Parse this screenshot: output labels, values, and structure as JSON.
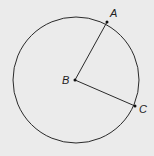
{
  "diagram": {
    "type": "circle-with-radii",
    "circle": {
      "center": "B",
      "cx": 76,
      "cy": 80,
      "r": 63
    },
    "points": [
      {
        "id": "A",
        "label": "A",
        "x": 107,
        "y": 22,
        "label_x": 110,
        "label_y": 17
      },
      {
        "id": "B",
        "label": "B",
        "x": 75,
        "y": 80,
        "label_x": 62,
        "label_y": 84
      },
      {
        "id": "C",
        "label": "C",
        "x": 135,
        "y": 106,
        "label_x": 139,
        "label_y": 113
      }
    ],
    "segments": [
      {
        "from": "B",
        "to": "A"
      },
      {
        "from": "B",
        "to": "C"
      }
    ],
    "colors": {
      "stroke": "#2a2a2a",
      "background": "#ebebeb"
    }
  }
}
